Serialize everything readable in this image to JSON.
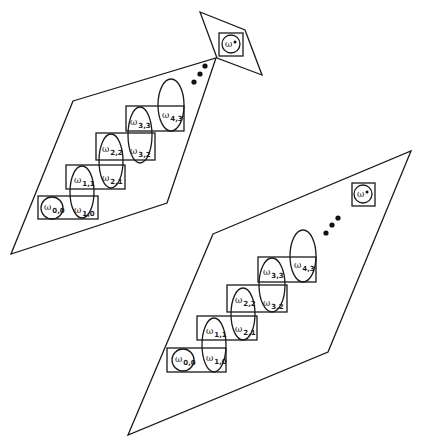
{
  "symbols": {
    "omega": "ω",
    "star": "*"
  },
  "diagrams": [
    {
      "name": "upper-diagram",
      "parallelogram": "73,101 216,58 167,203 11,254",
      "star_region": "200,12 245,30 262,75 217,58",
      "star_box": {
        "x": 219,
        "y": 33,
        "w": 24,
        "h": 23,
        "cx": 231,
        "cy": 44,
        "r": 9,
        "label": "ω",
        "sup": "*"
      },
      "dots": [
        [
          194,
          82
        ],
        [
          200,
          74
        ],
        [
          205,
          66
        ]
      ],
      "boxes": [
        {
          "x": 38,
          "y": 196,
          "w": 60,
          "h": 23
        },
        {
          "x": 66,
          "y": 165,
          "w": 59,
          "h": 24
        },
        {
          "x": 96,
          "y": 133,
          "w": 59,
          "h": 27
        },
        {
          "x": 126,
          "y": 106,
          "w": 58,
          "h": 25
        }
      ],
      "circle": {
        "cx": 52,
        "cy": 208,
        "r": 11
      },
      "ellipses": [
        {
          "cx": 82,
          "cy": 192,
          "rx": 12,
          "ry": 26
        },
        {
          "cx": 111,
          "cy": 161,
          "rx": 12,
          "ry": 27
        },
        {
          "cx": 140,
          "cy": 135,
          "rx": 12,
          "ry": 28
        },
        {
          "cx": 171,
          "cy": 105,
          "rx": 13,
          "ry": 26
        }
      ],
      "labels": [
        {
          "x": 44,
          "y": 210,
          "sub": "0,0"
        },
        {
          "x": 74,
          "y": 213,
          "sub": "1,0"
        },
        {
          "x": 74,
          "y": 183,
          "sub": "1,1"
        },
        {
          "x": 102,
          "y": 181,
          "sub": "2,1"
        },
        {
          "x": 102,
          "y": 152,
          "sub": "2,2"
        },
        {
          "x": 130,
          "y": 154,
          "sub": "3,2"
        },
        {
          "x": 130,
          "y": 125,
          "sub": "3,3"
        },
        {
          "x": 162,
          "y": 118,
          "sub": "4,3"
        }
      ]
    },
    {
      "name": "lower-diagram",
      "parallelogram": "213,234 411,151 328,352 128,435",
      "star_box": {
        "x": 352,
        "y": 183,
        "w": 23,
        "h": 23,
        "cx": 363,
        "cy": 194,
        "r": 9,
        "label": "ω",
        "sup": "*"
      },
      "dots": [
        [
          326,
          233
        ],
        [
          332,
          225
        ],
        [
          338,
          218
        ]
      ],
      "boxes": [
        {
          "x": 167,
          "y": 348,
          "w": 59,
          "h": 24
        },
        {
          "x": 197,
          "y": 316,
          "w": 60,
          "h": 24
        },
        {
          "x": 227,
          "y": 285,
          "w": 60,
          "h": 27
        },
        {
          "x": 258,
          "y": 257,
          "w": 58,
          "h": 25
        }
      ],
      "circle": {
        "cx": 183,
        "cy": 360,
        "r": 11
      },
      "ellipses": [
        {
          "cx": 214,
          "cy": 345,
          "rx": 12,
          "ry": 27
        },
        {
          "cx": 243,
          "cy": 314,
          "rx": 12,
          "ry": 26
        },
        {
          "cx": 272,
          "cy": 285,
          "rx": 13,
          "ry": 27
        },
        {
          "cx": 303,
          "cy": 256,
          "rx": 13,
          "ry": 26
        }
      ],
      "labels": [
        {
          "x": 175,
          "y": 362,
          "sub": "0,0"
        },
        {
          "x": 206,
          "y": 361,
          "sub": "1,0"
        },
        {
          "x": 206,
          "y": 334,
          "sub": "1,1"
        },
        {
          "x": 235,
          "y": 304,
          "sub": "2,1"
        },
        {
          "x": 235,
          "y": 303,
          "sub": "2,2"
        },
        {
          "x": 263,
          "y": 306,
          "sub": "3,2"
        },
        {
          "x": 263,
          "y": 275,
          "sub": "3,3"
        },
        {
          "x": 294,
          "y": 268,
          "sub": "4,3"
        }
      ]
    }
  ]
}
